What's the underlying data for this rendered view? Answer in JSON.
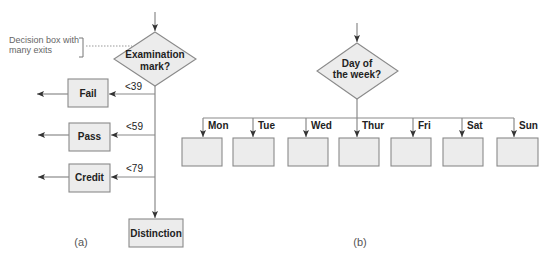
{
  "diagram_a": {
    "annotation": {
      "line1": "Decision box with",
      "line2": "many exits"
    },
    "decision": {
      "line1": "Examination",
      "line2": "mark?"
    },
    "outcomes": [
      {
        "label": "Fail",
        "condition": "<39"
      },
      {
        "label": "Pass",
        "condition": "<59"
      },
      {
        "label": "Credit",
        "condition": "<79"
      },
      {
        "label": "Distinction",
        "condition": ""
      }
    ],
    "caption": "(a)"
  },
  "diagram_b": {
    "decision": {
      "line1": "Day of",
      "line2": "the week?"
    },
    "branches": [
      {
        "label": "Mon"
      },
      {
        "label": "Tue"
      },
      {
        "label": "Wed"
      },
      {
        "label": "Thur"
      },
      {
        "label": "Fri"
      },
      {
        "label": "Sat"
      },
      {
        "label": "Sun"
      }
    ],
    "caption": "(b)"
  },
  "colors": {
    "fill": "#ececec",
    "stroke": "#8a8a8a",
    "text": "#222222",
    "note": "#666666"
  }
}
